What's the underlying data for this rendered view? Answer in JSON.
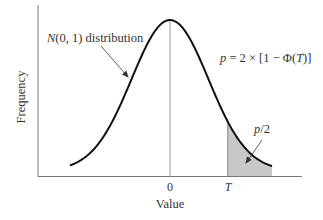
{
  "chart_data": {
    "type": "area",
    "title": "",
    "xlabel": "Value",
    "ylabel": "Frequency",
    "distribution": "standard normal N(0,1)",
    "x_ticks": [
      {
        "label": "0",
        "value": 0
      },
      {
        "label": "T",
        "value": 1.3
      }
    ],
    "xlim": [
      -3.0,
      3.0
    ],
    "curve": {
      "name": "N(0, 1) distribution",
      "mean": 0,
      "sd": 1
    },
    "shaded_region": {
      "from": "T",
      "to": "+inf",
      "label": "p/2",
      "color": "#c8c8c8"
    },
    "annotations": [
      {
        "text": "N(0, 1) distribution",
        "points_to": "curve left flank"
      },
      {
        "text": "p = 2 × [1 − Φ(T)]",
        "position": "upper right"
      },
      {
        "text": "p/2",
        "points_to": "shaded right tail"
      }
    ],
    "grid": false,
    "legend": "none"
  },
  "labels": {
    "ylabel": "Frequency",
    "xlabel": "Value",
    "tick_zero": "0",
    "tick_T": "T",
    "curve_name_N": "N",
    "curve_name_rest": "(0, 1) distribution",
    "formula_p": "p",
    "formula_mid": " = 2 × [1 − Φ(",
    "formula_T": "T",
    "formula_end": ")]",
    "tail_p": "p",
    "tail_rest": "/2"
  },
  "colors": {
    "curve": "#111111",
    "axis": "#777777",
    "center_line": "#999999",
    "shade": "#c8c8c8",
    "text": "#333333"
  }
}
